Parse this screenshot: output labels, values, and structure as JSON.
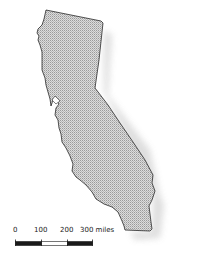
{
  "map": {
    "subject": "California state outline",
    "fill_pattern": "dotted-halftone",
    "colors": {
      "fill": "#d6d6d6",
      "fill_dot": "#9a9a9a",
      "outline": "#2a2a2a",
      "shadow": "#b5b5b5",
      "background": "#ffffff"
    }
  },
  "scale_bar": {
    "ticks": [
      "0",
      "100",
      "200",
      "300 miles"
    ],
    "unit": "miles",
    "segments": [
      {
        "from": 0,
        "to": 100,
        "fill": "#1a1a1a"
      },
      {
        "from": 100,
        "to": 200,
        "fill": "#ffffff"
      },
      {
        "from": 200,
        "to": 300,
        "fill": "#1a1a1a"
      }
    ]
  }
}
